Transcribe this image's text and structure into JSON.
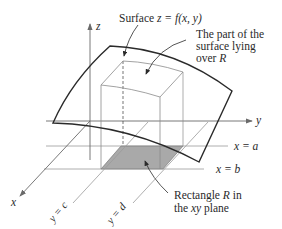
{
  "figure": {
    "type": "3D surface over rectangle diagram",
    "axes": {
      "z_label": "z",
      "y_label": "y",
      "x_label": "x"
    },
    "labels": {
      "surface_prefix": "Surface ",
      "surface_eq": "z = f(x, y)",
      "part_line1": "The part of the",
      "part_line2": "surface lying",
      "part_line3_prefix": "over ",
      "part_line3_var": "R",
      "rect_line1_prefix": "Rectangle ",
      "rect_line1_var": "R",
      "rect_line1_suffix": " in",
      "rect_line2_prefix": "the ",
      "rect_line2_var": "xy",
      "rect_line2_suffix": " plane",
      "x_eq_a": "x = a",
      "x_eq_b": "x = b",
      "y_eq_c": "y = c",
      "y_eq_d": "y = d"
    },
    "colors": {
      "stroke": "#2a2a2a",
      "thin": "#8a8a8a",
      "shade": "#a9a9a9",
      "background": "#ffffff"
    }
  }
}
